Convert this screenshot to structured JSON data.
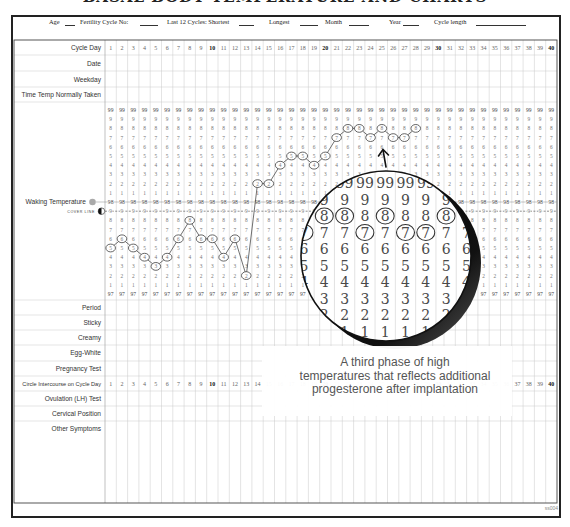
{
  "document": {
    "title": "BASAL BODY TEMPERATURE AND CHARTS",
    "form_code": "ss004"
  },
  "header_fields": [
    {
      "label": "Age"
    },
    {
      "label": "Fertility Cycle No:"
    },
    {
      "label": "Last 12 Cycles:  Shortest"
    },
    {
      "label": "Longest"
    },
    {
      "label": "Month"
    },
    {
      "label": "Year"
    },
    {
      "label": "Cycle length"
    }
  ],
  "top_rows": [
    "Cycle Day",
    "Date",
    "Weekday",
    "Time Temp Normally Taken"
  ],
  "days": [
    1,
    2,
    3,
    4,
    5,
    6,
    7,
    8,
    9,
    10,
    11,
    12,
    13,
    14,
    15,
    16,
    17,
    18,
    19,
    20,
    21,
    22,
    23,
    24,
    25,
    26,
    27,
    28,
    29,
    30,
    31,
    32,
    33,
    34,
    35,
    36,
    37,
    38,
    39,
    40
  ],
  "bold_days": [
    10,
    20,
    30,
    40
  ],
  "temp_section": {
    "label": "Waking Temperature",
    "cover_line_label": "COVER LINE",
    "cover_line_value": 97.9,
    "scale_labels": [
      "99",
      "9",
      "8",
      "7",
      "6",
      "5",
      "4",
      "3",
      "2",
      "1",
      "98",
      "9",
      "8",
      "7",
      "6",
      "5",
      "4",
      "3",
      "2",
      "1",
      "97"
    ]
  },
  "bottom_rows": [
    "Period",
    "Sticky",
    "Creamy",
    "Egg-White",
    "Pregnancy Test",
    "Circle Intercourse on Cycle Day",
    "Ovulation (LH) Test",
    "Cervical Position",
    "Other Symptoms"
  ],
  "intercourse_row_index": 5,
  "magnifier": {
    "days": [
      21,
      22,
      23,
      24,
      25,
      26,
      27,
      28,
      29
    ],
    "scale_labels": [
      "99",
      "9",
      "8",
      "7",
      "6",
      "5",
      "4",
      "3",
      "2",
      "1"
    ]
  },
  "callout": {
    "lines": [
      "A third phase of high",
      "temperatures that reflects additional",
      "progesterone after implantation"
    ]
  },
  "chart_data": {
    "type": "line",
    "title": "",
    "xlabel": "Cycle Day",
    "ylabel": "Waking Temperature",
    "x": [
      1,
      2,
      3,
      4,
      5,
      6,
      7,
      8,
      9,
      10,
      11,
      12,
      13,
      14,
      15,
      16,
      17,
      18,
      19,
      20,
      21,
      22,
      23,
      24,
      25,
      26,
      27,
      28
    ],
    "values": [
      97.5,
      97.6,
      97.5,
      97.4,
      97.3,
      97.4,
      97.6,
      97.8,
      97.6,
      97.6,
      97.4,
      97.6,
      97.2,
      98.2,
      98.2,
      98.4,
      98.5,
      98.5,
      98.4,
      98.5,
      98.7,
      98.8,
      98.8,
      98.7,
      98.8,
      98.7,
      98.7,
      98.8
    ],
    "xlim": [
      1,
      40
    ],
    "ylim": [
      97.0,
      99.0
    ],
    "x_tick_labels": [
      "1",
      "2",
      "3",
      "4",
      "5",
      "6",
      "7",
      "8",
      "9",
      "10",
      "11",
      "12",
      "13",
      "14",
      "15",
      "16",
      "17",
      "18",
      "19",
      "20",
      "21",
      "22",
      "23",
      "24",
      "25",
      "26",
      "27",
      "28",
      "29",
      "30",
      "31",
      "32",
      "33",
      "34",
      "35",
      "36",
      "37",
      "38",
      "39",
      "40"
    ],
    "y_tick_labels": [
      "99",
      "9",
      "8",
      "7",
      "6",
      "5",
      "4",
      "3",
      "2",
      "1",
      "98",
      "9",
      "8",
      "7",
      "6",
      "5",
      "4",
      "3",
      "2",
      "1",
      "97"
    ],
    "cover_line": 97.9,
    "grid": true,
    "legend": "none",
    "annotations": [
      {
        "text": "A third phase of high temperatures that reflects additional progesterone after implantation",
        "magnified_days": [
          21,
          29
        ]
      }
    ]
  }
}
